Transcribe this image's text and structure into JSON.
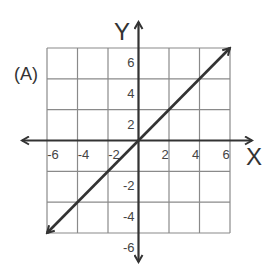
{
  "label": "(A)",
  "chart_data": {
    "type": "line",
    "title": "",
    "panel_label": "(A)",
    "xlabel": "X",
    "ylabel": "Y",
    "xlim": [
      -6,
      6
    ],
    "ylim": [
      -6,
      6
    ],
    "grid": true,
    "grid_step": 2,
    "x_ticks": [
      -6,
      -4,
      -2,
      2,
      4,
      6
    ],
    "y_ticks": [
      6,
      4,
      2,
      -2,
      -4,
      -6
    ],
    "x_tick_labels": [
      "-6",
      "-4",
      "-2",
      "2",
      "4",
      "6"
    ],
    "y_tick_labels": [
      "6",
      "4",
      "2",
      "-2",
      "-4",
      "-6"
    ],
    "series": [
      {
        "name": "y = x",
        "x": [
          -6,
          6
        ],
        "y": [
          -6,
          6
        ],
        "arrows": "both",
        "color": "#333333"
      }
    ],
    "legend": null
  }
}
